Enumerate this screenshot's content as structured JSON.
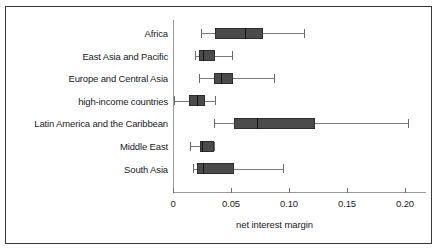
{
  "chart_data": {
    "type": "box",
    "title": "",
    "xlabel": "net interest margin",
    "ylabel": "",
    "orientation": "horizontal",
    "xlim": [
      0,
      0.215
    ],
    "xticks": [
      0,
      0.05,
      0.1,
      0.15,
      0.2
    ],
    "xticklabels": [
      "0",
      "0.05",
      "0.10",
      "0.15",
      "0.20"
    ],
    "grid": false,
    "legend": null,
    "categories": [
      "Africa",
      "East Asia and Pacific",
      "Europe and Central Asia",
      "high-income countries",
      "Latin America and the Caribbean",
      "Middle East",
      "South Asia"
    ],
    "boxes": [
      {
        "category": "Africa",
        "whisker_low": 0.024,
        "q1": 0.036,
        "median": 0.062,
        "q3": 0.078,
        "whisker_high": 0.113
      },
      {
        "category": "East Asia and Pacific",
        "whisker_low": 0.019,
        "q1": 0.022,
        "median": 0.026,
        "q3": 0.036,
        "whisker_high": 0.051
      },
      {
        "category": "Europe and Central Asia",
        "whisker_low": 0.022,
        "q1": 0.035,
        "median": 0.041,
        "q3": 0.052,
        "whisker_high": 0.087
      },
      {
        "category": "high-income countries",
        "whisker_low": 0.001,
        "q1": 0.014,
        "median": 0.021,
        "q3": 0.028,
        "whisker_high": 0.036
      },
      {
        "category": "Latin America and the Caribbean",
        "whisker_low": 0.035,
        "q1": 0.053,
        "median": 0.072,
        "q3": 0.122,
        "whisker_high": 0.203
      },
      {
        "category": "Middle East",
        "whisker_low": 0.015,
        "q1": 0.023,
        "median": 0.025,
        "q3": 0.035,
        "whisker_high": 0.035
      },
      {
        "category": "South Asia",
        "whisker_low": 0.017,
        "q1": 0.021,
        "median": 0.026,
        "q3": 0.053,
        "whisker_high": 0.095
      }
    ],
    "colors": {
      "box_fill": "#4b4b4b",
      "box_edge": "#2e2e2e",
      "median": "#151515",
      "whisker": "#7b7b7b",
      "axis": "#9a9a9a",
      "frame": "#3a3a3a",
      "text": "#1b1b1b",
      "background": "#ffffff"
    }
  }
}
